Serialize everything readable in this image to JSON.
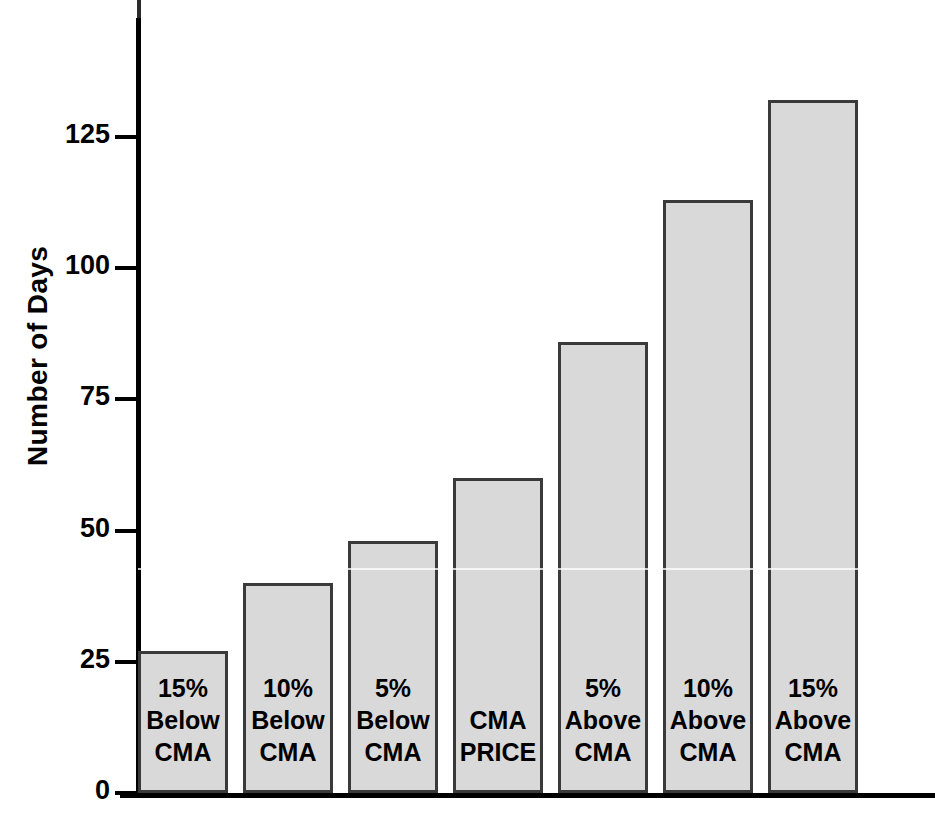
{
  "chart_data": {
    "type": "bar",
    "title": "",
    "subtitle": "",
    "xlabel": "",
    "ylabel": "Number of Days",
    "categories": [
      "15% Below CMA",
      "10% Below CMA",
      "5% Below CMA",
      "CMA PRICE",
      "5% Above CMA",
      "10% Above CMA",
      "15% Above CMA"
    ],
    "category_lines": [
      [
        "15%",
        "Below",
        "CMA"
      ],
      [
        "10%",
        "Below",
        "CMA"
      ],
      [
        "5%",
        "Below",
        "CMA"
      ],
      [
        "CMA",
        "PRICE"
      ],
      [
        "5%",
        "Above",
        "CMA"
      ],
      [
        "10%",
        "Above",
        "CMA"
      ],
      [
        "15%",
        "Above",
        "CMA"
      ]
    ],
    "values": [
      27,
      40,
      48,
      60,
      86,
      113,
      132
    ],
    "ylim": [
      0,
      150
    ],
    "yticks": [
      0,
      25,
      50,
      75,
      100,
      125
    ],
    "ytick_labels": [
      "0",
      "25",
      "50",
      "75",
      "100",
      "125"
    ],
    "grid": false,
    "legend": null,
    "bar_fill_color": "#d9d9d9",
    "bar_edge_color": "#3a3a3a",
    "axis_color": "#000000",
    "background_color": "#ffffff"
  },
  "axis": {
    "y_title": "Number of Days",
    "ticks": [
      {
        "label": "125",
        "value": 125
      },
      {
        "label": "100",
        "value": 100
      },
      {
        "label": "75",
        "value": 75
      },
      {
        "label": "50",
        "value": 50
      },
      {
        "label": "25",
        "value": 25
      },
      {
        "label": "0",
        "value": 0
      }
    ]
  }
}
